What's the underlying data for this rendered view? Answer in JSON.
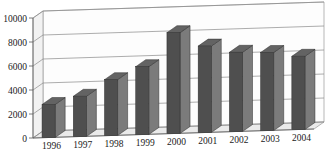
{
  "chart_data": {
    "type": "bar",
    "title": "",
    "subtitle": "",
    "xlabel": "",
    "ylabel": "",
    "categories": [
      "1996",
      "1997",
      "1998",
      "1999",
      "2000",
      "2001",
      "2002",
      "2003",
      "2004"
    ],
    "values": [
      2750,
      3350,
      4650,
      5650,
      8400,
      7200,
      6600,
      6500,
      6100
    ],
    "series": [
      {
        "name": "",
        "values": [
          2750,
          3350,
          4650,
          5650,
          8400,
          7200,
          6500,
          6500,
          6100
        ]
      }
    ],
    "ylim": [
      0,
      10000
    ],
    "ytick_labels": [
      "0",
      "2000",
      "4000",
      "6000",
      "8000",
      "10000"
    ],
    "ytick_values": [
      0,
      2000,
      4000,
      6000,
      8000,
      10000
    ],
    "xtick_labels": [
      "1996",
      "1997",
      "1998",
      "1999",
      "2000",
      "2001",
      "2002",
      "2003",
      "2004"
    ],
    "grid": true,
    "legend": false,
    "legend_position": "none",
    "style": "3d-column",
    "annotations": [],
    "colors": {
      "bar_front": "#4f4f4f",
      "bar_side": "#7b7b7b",
      "bar_top": "#636363",
      "grid": "#8a8a8a",
      "axis": "#5a5a5a",
      "plot_background": "#fdfdfd",
      "wall_left": "#f2f2f2",
      "floor": "#eaeaea",
      "text": "#1a1a1a",
      "page_background": "#ffffff"
    }
  }
}
